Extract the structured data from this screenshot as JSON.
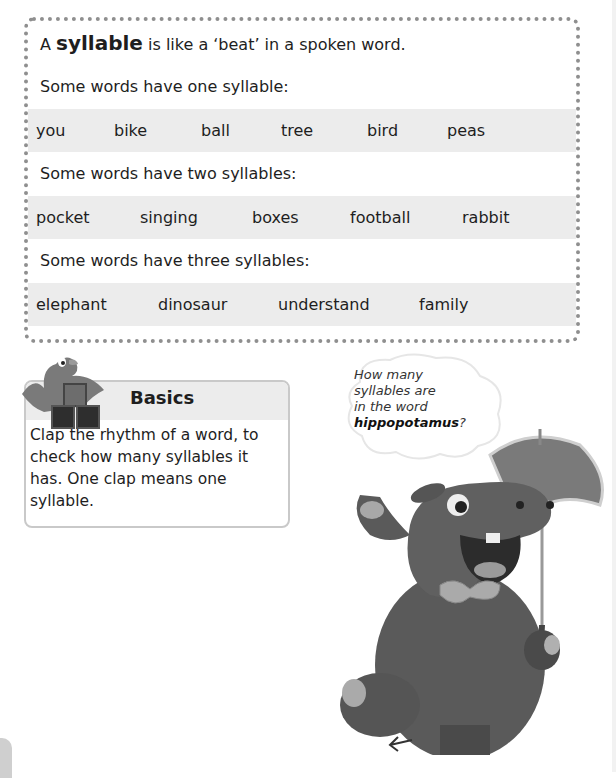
{
  "intro": {
    "prefix": "A ",
    "term": "syllable",
    "suffix": " is like a ‘beat’ in a spoken word."
  },
  "groups": [
    {
      "label": "Some words have one syllable:",
      "words": [
        "you",
        "bike",
        "ball",
        "tree",
        "bird",
        "peas"
      ]
    },
    {
      "label": "Some words have two syllables:",
      "words": [
        "pocket",
        "singing",
        "boxes",
        "football",
        "rabbit"
      ]
    },
    {
      "label": "Some words have three syllables:",
      "words": [
        "elephant",
        "dinosaur",
        "understand",
        "family"
      ]
    }
  ],
  "basics": {
    "title": "Basics",
    "body": "Clap the rhythm of a word, to check how many syllables it has. One clap means one syllable.",
    "icon": "bird-with-blocks-icon"
  },
  "speech_bubble": {
    "line1": "How many",
    "line2": "syllables are",
    "line3": "in the word",
    "emphasis": "hippopotamus",
    "end": "?"
  },
  "illustration": {
    "name": "hippo-with-umbrella"
  },
  "colors": {
    "border": "#8f8f8f",
    "row_bg": "#ececec",
    "text": "#1e1e1e"
  }
}
